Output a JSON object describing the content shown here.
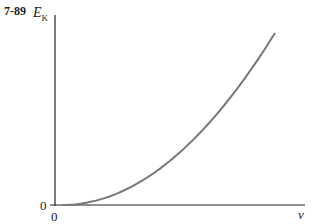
{
  "figure_number": "7-89",
  "chart_data": {
    "type": "line",
    "title": "",
    "xlabel": "v",
    "ylabel": "E_K",
    "ylabel_main": "E",
    "ylabel_sub": "K",
    "x_tick_labels": [
      "0"
    ],
    "y_tick_labels": [
      "0"
    ],
    "grid": false,
    "legend": null,
    "series": [
      {
        "name": "kinetic energy",
        "shape": "parabola (E_K ∝ v²)",
        "x": [
          0,
          0.2,
          0.4,
          0.6,
          0.8,
          1.0
        ],
        "y": [
          0,
          0.04,
          0.16,
          0.36,
          0.64,
          1.0
        ],
        "color": "#777777"
      }
    ],
    "xlim": [
      0,
      1.15
    ],
    "ylim": [
      0,
      1.1
    ]
  }
}
